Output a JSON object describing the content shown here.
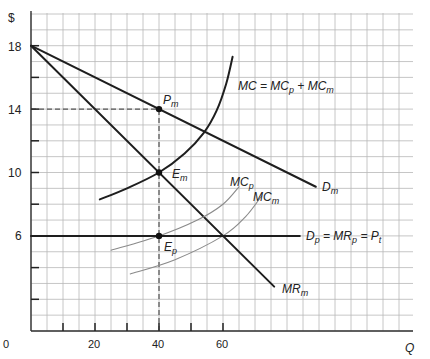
{
  "chart_data": {
    "type": "line",
    "title": "",
    "xlabel": "Q",
    "ylabel": "$",
    "xlim": [
      0,
      120
    ],
    "ylim": [
      0,
      20
    ],
    "grid": true,
    "x_ticks": [
      0,
      20,
      40,
      60
    ],
    "x_minor_ticks": [
      10,
      20,
      30,
      40,
      50,
      60
    ],
    "y_ticks": [
      6,
      10,
      14,
      18
    ],
    "y_minor_ticks": [
      2,
      4,
      8,
      12,
      16
    ],
    "series": [
      {
        "name": "D_m",
        "label": "Dm",
        "style": "dark",
        "points": [
          [
            0,
            18
          ],
          [
            89,
            9.1
          ]
        ]
      },
      {
        "name": "MR_m",
        "label": "MRm",
        "style": "dark",
        "points": [
          [
            0,
            18
          ],
          [
            76,
            2.8
          ]
        ]
      },
      {
        "name": "MC",
        "label": "MC = MCp + MCm",
        "style": "dark",
        "points": [
          [
            21.5,
            8.3
          ],
          [
            30,
            9.0
          ],
          [
            40,
            10
          ],
          [
            48,
            11.2
          ],
          [
            54,
            12.5
          ],
          [
            58,
            13.9
          ],
          [
            61,
            15.6
          ],
          [
            63,
            17.3
          ]
        ]
      },
      {
        "name": "MC_p",
        "label": "MCp",
        "style": "light",
        "points": [
          [
            25,
            5.1
          ],
          [
            40,
            6.0
          ],
          [
            52,
            7.0
          ],
          [
            60,
            8.0
          ],
          [
            65,
            9.1
          ]
        ]
      },
      {
        "name": "MC_m",
        "label": "MCm",
        "style": "light",
        "points": [
          [
            31,
            3.6
          ],
          [
            45,
            4.5
          ],
          [
            60,
            6.0
          ],
          [
            67,
            7.2
          ],
          [
            72,
            8.5
          ]
        ]
      },
      {
        "name": "D_p",
        "label": "Dp = MRp = Pt",
        "style": "dark",
        "points": [
          [
            0,
            6
          ],
          [
            84,
            6
          ]
        ]
      }
    ],
    "points": [
      {
        "name": "Pm",
        "x": 40,
        "y": 14
      },
      {
        "name": "Em",
        "x": 40,
        "y": 10
      },
      {
        "name": "Ep",
        "x": 40,
        "y": 6
      }
    ],
    "reference_lines": [
      {
        "type": "horizontal-dashed",
        "y": 14,
        "x_from": 0,
        "x_to": 40
      },
      {
        "type": "vertical-dashed",
        "x": 40,
        "y_from": 0,
        "y_to": 14
      }
    ]
  },
  "labels": {
    "y_axis": "$",
    "x_axis": "Q",
    "y18": "18",
    "y14": "14",
    "y10": "10",
    "y6": "6",
    "x0": "0",
    "x20": "20",
    "x40": "40",
    "x60": "60",
    "dm": "D",
    "dm_sub": "m",
    "mrm": "MR",
    "mrm_sub": "m",
    "mc_main": "MC = MC",
    "mc_sub1": "p",
    "mc_plus": " + MC",
    "mc_sub2": "m",
    "mcp": "MC",
    "mcp_sub": "p",
    "mcm": "MC",
    "mcm_sub": "m",
    "dp": "D",
    "dp_sub": "p",
    "dp_eq": " = MR",
    "dp_sub2": "p",
    "dp_eq2": " = P",
    "dp_sub3": "t",
    "pm": "P",
    "pm_sub": "m",
    "em": "E",
    "em_sub": "m",
    "ep": "E",
    "ep_sub": "p"
  }
}
